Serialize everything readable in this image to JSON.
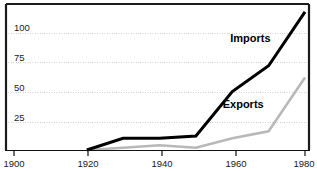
{
  "chart_data": {
    "type": "line",
    "title": "",
    "xlabel": "",
    "ylabel": "",
    "xlim": [
      1900,
      1985
    ],
    "ylim": [
      0,
      125
    ],
    "xticks": [
      1900,
      1920,
      1940,
      1960,
      1980
    ],
    "xtick_labels": [
      "1900",
      "1920",
      "1940",
      "1960",
      "1980"
    ],
    "yticks": [
      25,
      50,
      75,
      100
    ],
    "ytick_labels": [
      "25",
      "50",
      "75",
      "100"
    ],
    "grid": true,
    "grid_style": "dotted-horizontal",
    "legend": "inline-labels",
    "series": [
      {
        "name": "Imports",
        "color": "#000000",
        "line_width": 3,
        "x": [
          1920,
          1930,
          1940,
          1950,
          1960,
          1970,
          1980
        ],
        "values": [
          0,
          10,
          10,
          12,
          50,
          72,
          118
        ]
      },
      {
        "name": "Exports",
        "color": "#b8b8b8",
        "line_width": 2.5,
        "x": [
          1920,
          1930,
          1940,
          1950,
          1960,
          1970,
          1980
        ],
        "values": [
          0,
          2,
          4,
          2,
          10,
          16,
          62
        ]
      }
    ],
    "annotations": [
      {
        "text": "Imports",
        "x": 1965,
        "y": 92
      },
      {
        "text": "Exports",
        "x": 1963,
        "y": 36
      }
    ],
    "colors": {
      "frame": "#111111",
      "grid": "#d2d2d2",
      "imports": "#000000",
      "exports": "#bcbcbc",
      "text": "#1a1a1a",
      "background": "#ffffff"
    }
  }
}
